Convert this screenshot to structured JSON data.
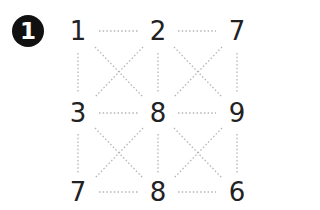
{
  "badge": {
    "label": "1"
  },
  "grid": {
    "rows": [
      [
        "1",
        "2",
        "7"
      ],
      [
        "3",
        "8",
        "9"
      ],
      [
        "7",
        "8",
        "6"
      ]
    ]
  },
  "colors": {
    "line": "#b5b5b5",
    "text": "#222222",
    "badge_bg": "#111111"
  }
}
